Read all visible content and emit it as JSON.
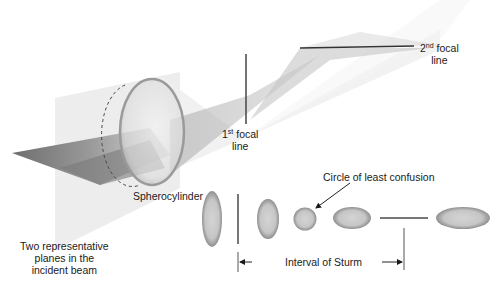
{
  "diagram": {
    "labels": {
      "first_focal": {
        "ordinal": "1",
        "sup": "st",
        "line1_rest": " focal",
        "line2": "line"
      },
      "second_focal": {
        "ordinal": "2",
        "sup": "nd",
        "line1_rest": " focal",
        "line2": "line"
      },
      "spherocylinder": "Spherocylinder",
      "circle_least_confusion": "Circle of least confusion",
      "interval_of_sturm": "Interval of Sturm",
      "incident_planes": {
        "line1": "Two representative",
        "line2": "planes in the",
        "line3": "incident beam"
      }
    },
    "cross_sections": [
      {
        "name": "vertical-ellipse-at-lens",
        "shape": "ellipse",
        "orientation": "vertical"
      },
      {
        "name": "first-focal-line-section",
        "shape": "line",
        "orientation": "vertical"
      },
      {
        "name": "vertical-ellipse",
        "shape": "ellipse",
        "orientation": "vertical"
      },
      {
        "name": "circle-of-least-confusion",
        "shape": "circle",
        "orientation": "none"
      },
      {
        "name": "horizontal-ellipse",
        "shape": "ellipse",
        "orientation": "horizontal"
      },
      {
        "name": "second-focal-line-section",
        "shape": "line",
        "orientation": "horizontal"
      },
      {
        "name": "horizontal-ellipse-beyond",
        "shape": "ellipse",
        "orientation": "horizontal"
      }
    ],
    "colors": {
      "ellipse_fill": "#c9c9c9",
      "ellipse_edge": "#8f8f8f",
      "line": "#444444",
      "beam_light": "#e6e6e6",
      "beam_dark": "#8a8a8a"
    }
  }
}
